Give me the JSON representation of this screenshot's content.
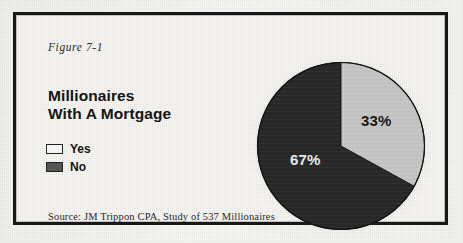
{
  "figure": {
    "label": "Figure 7-1",
    "title_line1": "Millionaires",
    "title_line2": "With A Mortgage",
    "source": "Source: JM Trippon CPA, Study of 537 Millionaires"
  },
  "legend": {
    "items": [
      {
        "label": "Yes",
        "swatch": "white-swatch-icon",
        "color": "#ffffff"
      },
      {
        "label": "No",
        "swatch": "gray-swatch-icon",
        "color": "#5a5a5a"
      }
    ]
  },
  "chart_data": {
    "type": "pie",
    "title": "Millionaires With A Mortgage",
    "categories": [
      "Yes",
      "No"
    ],
    "values": [
      33,
      67
    ],
    "labels": [
      "33%",
      "67%"
    ],
    "colors": [
      "#cfcfcf",
      "#2a2a2a"
    ],
    "legend_position": "left",
    "units": "percent",
    "start_angle_deg": 0,
    "direction": "clockwise",
    "annotations": [
      "Source: JM Trippon CPA, Study of 537 Millionaires"
    ],
    "xlabel": "",
    "ylabel": ""
  }
}
